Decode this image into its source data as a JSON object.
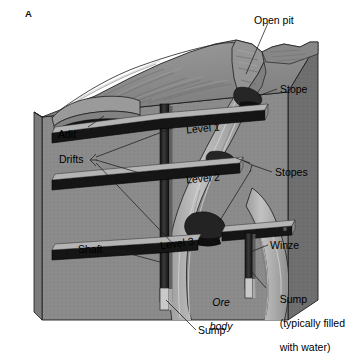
{
  "figure": {
    "panel_label": "A",
    "type": "geological block diagram"
  },
  "labels": {
    "open_pit": "Open pit",
    "stope": "Stope",
    "stopes": "Stopes",
    "adit": "Adit",
    "drifts": "Drifts",
    "level1": "Level 1",
    "level2": "Level 2",
    "level3": "Level 3",
    "shaft": "Shaft",
    "winze": "Winze",
    "ore_body_line1": "Ore",
    "ore_body_line2": "body",
    "sump_bottom": "Sump",
    "sump_right_line1": "Sump",
    "sump_right_line2": "(typically filled",
    "sump_right_line3": "with water)"
  },
  "colors": {
    "background": "#ffffff",
    "block_front": "#8a8a8a",
    "block_side": "#6e6e6e",
    "block_top": "#9a9a9a",
    "terrain": "#8f8f8f",
    "terrain_shade": "#737373",
    "tunnel_dark": "#1e1e1e",
    "tunnel_edge": "#b9b9b9",
    "ore_vein": "#b0b0b0",
    "stope_fill": "#2a2a2a",
    "sump_fill": "#c9c9c9",
    "outline": "#1a1a1a",
    "leader_line": "#222222",
    "text": "#000000"
  },
  "elements": {
    "shaft": "vertical main shaft",
    "winze": "internal vertical shaft between levels",
    "drifts": "horizontal tunnels on each level",
    "adit": "horizontal entrance to surface",
    "open_pit": "surface excavation notch",
    "ore_body": "sinuous mineralized vein",
    "sumps": "water collection pits at shaft bottoms"
  }
}
